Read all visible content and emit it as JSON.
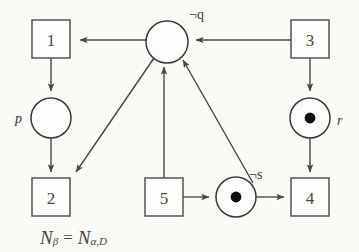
{
  "figure": {
    "type": "petri-net-diagram",
    "background_color": "#fbfaf6",
    "stroke_color": "#4a4846",
    "caption": {
      "net_symbol": "N",
      "net_subscript": "β",
      "equals": "=",
      "rhs_symbol": "N",
      "rhs_subscript": "α,D",
      "full_text": "Nβ = Nα,D"
    },
    "transitions": [
      {
        "id": "t1",
        "label": "1",
        "cx": 51,
        "cy": 39,
        "size": 38
      },
      {
        "id": "t2",
        "label": "2",
        "cx": 51,
        "cy": 197,
        "size": 38
      },
      {
        "id": "t3",
        "label": "3",
        "cx": 310,
        "cy": 39,
        "size": 38
      },
      {
        "id": "t4",
        "label": "4",
        "cx": 310,
        "cy": 197,
        "size": 38
      },
      {
        "id": "t5",
        "label": "5",
        "cx": 164,
        "cy": 197,
        "size": 38
      }
    ],
    "places": [
      {
        "id": "pq",
        "label": "¬q",
        "label_style": "negated",
        "cx": 167,
        "cy": 42,
        "r": 21,
        "tokens": 0,
        "label_x": 189,
        "label_y": 14
      },
      {
        "id": "pp",
        "label": "p",
        "label_style": "italic",
        "cx": 51,
        "cy": 118,
        "r": 20,
        "tokens": 0,
        "label_x": 21,
        "label_y": 118
      },
      {
        "id": "pr",
        "label": "r",
        "label_style": "italic",
        "cx": 310,
        "cy": 118,
        "r": 20,
        "tokens": 1,
        "label_x": 339,
        "label_y": 120
      },
      {
        "id": "ps",
        "label": "¬s",
        "label_style": "negated",
        "cx": 236,
        "cy": 197,
        "r": 20,
        "tokens": 1,
        "label_x": 251,
        "label_y": 174
      }
    ],
    "arcs": [
      {
        "id": "arc-q-to-1",
        "from": "pq",
        "to": "t1",
        "kind": "straight-horizontal"
      },
      {
        "id": "arc-3-to-q",
        "from": "t3",
        "to": "pq",
        "kind": "straight-horizontal"
      },
      {
        "id": "arc-1-to-p",
        "from": "t1",
        "to": "pp",
        "kind": "straight-vertical"
      },
      {
        "id": "arc-p-to-2",
        "from": "pp",
        "to": "t2",
        "kind": "straight-vertical"
      },
      {
        "id": "arc-q-to-2",
        "from": "pq",
        "to": "t2",
        "kind": "diagonal"
      },
      {
        "id": "arc-5-to-q",
        "from": "t5",
        "to": "pq",
        "kind": "straight-vertical"
      },
      {
        "id": "arc-s-to-q",
        "from": "ps",
        "to": "pq",
        "kind": "diagonal"
      },
      {
        "id": "arc-3-to-r",
        "from": "t3",
        "to": "pr",
        "kind": "straight-vertical"
      },
      {
        "id": "arc-r-to-4",
        "from": "pr",
        "to": "t4",
        "kind": "straight-vertical"
      },
      {
        "id": "arc-5-to-s",
        "from": "t5",
        "to": "ps",
        "kind": "straight-horizontal"
      },
      {
        "id": "arc-s-to-4",
        "from": "ps",
        "to": "t4",
        "kind": "straight-horizontal"
      }
    ]
  }
}
